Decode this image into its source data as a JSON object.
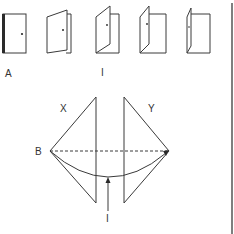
{
  "colors": {
    "stroke": "#3a3a3a",
    "background": "#ffffff",
    "text": "#333333"
  },
  "top_row": {
    "doors": [
      {
        "id": "door-1",
        "state": "closed"
      },
      {
        "id": "door-2",
        "state": "slightly-open"
      },
      {
        "id": "door-3",
        "state": "half-open"
      },
      {
        "id": "door-4",
        "state": "mostly-open"
      },
      {
        "id": "door-5",
        "state": "nearly-perpendicular"
      }
    ],
    "labels": {
      "a": "A",
      "i": "I"
    }
  },
  "bottom_diagram": {
    "labels": {
      "x": "X",
      "y": "Y",
      "b": "B",
      "i": "I"
    }
  }
}
